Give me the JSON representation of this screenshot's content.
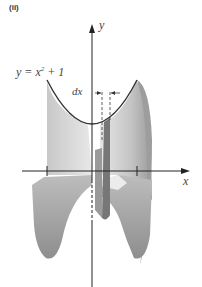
{
  "figure": {
    "panel_label": "(ii)",
    "equation": {
      "prefix": "y = x",
      "exponent": "2",
      "suffix": " + 1"
    },
    "differential_label": "dx",
    "axes": {
      "x_label": "x",
      "y_label": "y"
    },
    "colors": {
      "axis": "#222222",
      "curve": "#333333",
      "solid_light": "#d9d9d9",
      "solid_mid": "#b8b8b8",
      "solid_dark": "#8a8a8a",
      "background": "#ffffff"
    }
  }
}
